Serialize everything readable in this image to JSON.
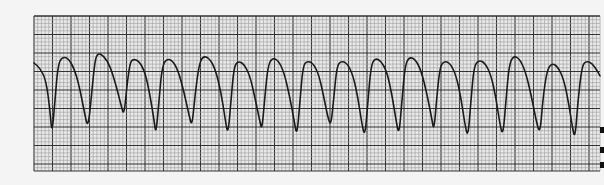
{
  "figure": {
    "type": "ecg-rhythm-strip",
    "colors": {
      "paper": "#f4f4f4",
      "minor_grid": "#9a9a9a",
      "major_grid": "#333333",
      "trace": "#1a1a1a"
    },
    "grid": {
      "left": 34,
      "top": 16,
      "right": 600,
      "bottom": 171,
      "minor_px": 3.7,
      "major_px": 18.5
    },
    "trace_points": [
      [
        34,
        63
      ],
      [
        40,
        68
      ],
      [
        46,
        80
      ],
      [
        50,
        110
      ],
      [
        52,
        135
      ],
      [
        55,
        100
      ],
      [
        58,
        65
      ],
      [
        62,
        57
      ],
      [
        68,
        58
      ],
      [
        74,
        68
      ],
      [
        79,
        85
      ],
      [
        84,
        110
      ],
      [
        88,
        130
      ],
      [
        92,
        90
      ],
      [
        95,
        60
      ],
      [
        98,
        53
      ],
      [
        104,
        56
      ],
      [
        110,
        66
      ],
      [
        116,
        85
      ],
      [
        121,
        105
      ],
      [
        124,
        116
      ],
      [
        127,
        85
      ],
      [
        130,
        63
      ],
      [
        133,
        59
      ],
      [
        139,
        61
      ],
      [
        145,
        72
      ],
      [
        150,
        95
      ],
      [
        154,
        120
      ],
      [
        156,
        135
      ],
      [
        159,
        100
      ],
      [
        162,
        68
      ],
      [
        166,
        59
      ],
      [
        172,
        60
      ],
      [
        178,
        70
      ],
      [
        184,
        92
      ],
      [
        189,
        115
      ],
      [
        192,
        127
      ],
      [
        195,
        95
      ],
      [
        199,
        65
      ],
      [
        203,
        56
      ],
      [
        209,
        58
      ],
      [
        215,
        68
      ],
      [
        221,
        92
      ],
      [
        225,
        118
      ],
      [
        228,
        136
      ],
      [
        231,
        100
      ],
      [
        234,
        67
      ],
      [
        238,
        61
      ],
      [
        244,
        64
      ],
      [
        250,
        76
      ],
      [
        255,
        98
      ],
      [
        260,
        122
      ],
      [
        262,
        130
      ],
      [
        265,
        95
      ],
      [
        268,
        66
      ],
      [
        272,
        58
      ],
      [
        278,
        60
      ],
      [
        284,
        72
      ],
      [
        290,
        98
      ],
      [
        294,
        120
      ],
      [
        297,
        137
      ],
      [
        300,
        100
      ],
      [
        303,
        66
      ],
      [
        307,
        61
      ],
      [
        313,
        63
      ],
      [
        319,
        75
      ],
      [
        324,
        98
      ],
      [
        328,
        118
      ],
      [
        331,
        126
      ],
      [
        334,
        95
      ],
      [
        337,
        66
      ],
      [
        341,
        61
      ],
      [
        347,
        63
      ],
      [
        353,
        75
      ],
      [
        358,
        98
      ],
      [
        362,
        125
      ],
      [
        365,
        137
      ],
      [
        368,
        100
      ],
      [
        371,
        66
      ],
      [
        375,
        58
      ],
      [
        381,
        61
      ],
      [
        387,
        72
      ],
      [
        392,
        95
      ],
      [
        396,
        120
      ],
      [
        399,
        136
      ],
      [
        402,
        100
      ],
      [
        405,
        66
      ],
      [
        409,
        57
      ],
      [
        415,
        59
      ],
      [
        421,
        70
      ],
      [
        427,
        94
      ],
      [
        432,
        120
      ],
      [
        434,
        131
      ],
      [
        437,
        95
      ],
      [
        440,
        67
      ],
      [
        444,
        61
      ],
      [
        450,
        63
      ],
      [
        456,
        75
      ],
      [
        461,
        98
      ],
      [
        465,
        125
      ],
      [
        468,
        138
      ],
      [
        471,
        100
      ],
      [
        474,
        66
      ],
      [
        479,
        60
      ],
      [
        485,
        63
      ],
      [
        491,
        75
      ],
      [
        496,
        98
      ],
      [
        500,
        125
      ],
      [
        503,
        136
      ],
      [
        506,
        100
      ],
      [
        509,
        66
      ],
      [
        513,
        56
      ],
      [
        519,
        58
      ],
      [
        525,
        70
      ],
      [
        531,
        94
      ],
      [
        536,
        120
      ],
      [
        540,
        135
      ],
      [
        543,
        98
      ],
      [
        547,
        70
      ],
      [
        552,
        63
      ],
      [
        558,
        67
      ],
      [
        564,
        80
      ],
      [
        569,
        105
      ],
      [
        572,
        125
      ],
      [
        575,
        140
      ],
      [
        578,
        100
      ],
      [
        582,
        66
      ],
      [
        586,
        61
      ],
      [
        592,
        63
      ],
      [
        598,
        72
      ],
      [
        600,
        76
      ]
    ],
    "edge_marks": [
      {
        "y": 130
      },
      {
        "y": 150
      },
      {
        "y": 165
      }
    ]
  }
}
